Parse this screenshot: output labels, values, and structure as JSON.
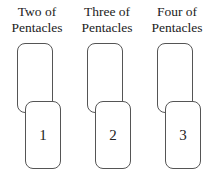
{
  "cards": [
    {
      "label_line1": "Two of",
      "label_line2": "Pentacles",
      "number": "1"
    },
    {
      "label_line1": "Three of",
      "label_line2": "Pentacles",
      "number": "2"
    },
    {
      "label_line1": "Four of",
      "label_line2": "Pentacles",
      "number": "3"
    }
  ]
}
